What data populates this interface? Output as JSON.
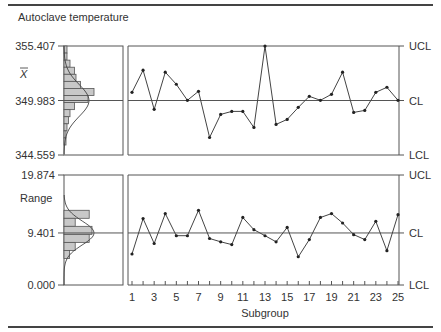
{
  "title": "Autoclave temperature",
  "chart_data": [
    {
      "type": "line",
      "name": "xbar-chart",
      "title": "Autoclave temperature",
      "ylabel": "X̄",
      "xlabel": "Subgroup",
      "ucl": 355.407,
      "cl": 349.983,
      "lcl": 344.559,
      "ylim": [
        344.559,
        355.407
      ],
      "y_tick_labels": [
        "355.407",
        "349.983",
        "344.559"
      ],
      "limit_labels": [
        "UCL",
        "CL",
        "LCL"
      ],
      "x": [
        1,
        2,
        3,
        4,
        5,
        6,
        7,
        8,
        9,
        10,
        11,
        12,
        13,
        14,
        15,
        16,
        17,
        18,
        19,
        20,
        21,
        22,
        23,
        24,
        25
      ],
      "values": [
        350.8,
        353.0,
        349.1,
        352.8,
        351.6,
        350.0,
        350.9,
        346.3,
        348.6,
        348.9,
        348.9,
        347.3,
        355.4,
        347.6,
        348.1,
        349.3,
        350.4,
        350.0,
        350.6,
        352.8,
        348.8,
        349.0,
        350.8,
        351.3,
        350.0
      ],
      "histogram": {
        "orientation": "horizontal",
        "bins": 14,
        "counts_relative": [
          0.1,
          0.1,
          0.2,
          0.35,
          0.4,
          0.55,
          1.0,
          0.8,
          0.35,
          0.2,
          0.15,
          0.1,
          0.05,
          0.05
        ]
      }
    },
    {
      "type": "line",
      "name": "range-chart",
      "ylabel": "Range",
      "xlabel": "Subgroup",
      "ucl": 19.874,
      "cl": 9.401,
      "lcl": 0.0,
      "ylim": [
        0,
        19.874
      ],
      "y_tick_labels": [
        "19.874",
        "9.401",
        "0.000"
      ],
      "limit_labels": [
        "UCL",
        "CL",
        "LCL"
      ],
      "x": [
        1,
        2,
        3,
        4,
        5,
        6,
        7,
        8,
        9,
        10,
        11,
        12,
        13,
        14,
        15,
        16,
        17,
        18,
        19,
        20,
        21,
        22,
        23,
        24,
        25
      ],
      "x_tick_labels": [
        "1",
        "3",
        "5",
        "7",
        "9",
        "11",
        "13",
        "15",
        "17",
        "19",
        "21",
        "23",
        "25"
      ],
      "values": [
        5.6,
        12.0,
        7.5,
        12.9,
        8.9,
        8.9,
        13.5,
        8.4,
        7.8,
        7.3,
        12.2,
        10.0,
        8.9,
        7.8,
        10.4,
        5.1,
        8.2,
        12.2,
        12.9,
        11.2,
        9.1,
        8.2,
        11.5,
        6.2,
        12.7
      ],
      "histogram": {
        "orientation": "horizontal",
        "bins": 6,
        "counts_relative": [
          0.9,
          0.4,
          1.0,
          0.9,
          0.4,
          0.2
        ]
      }
    }
  ]
}
